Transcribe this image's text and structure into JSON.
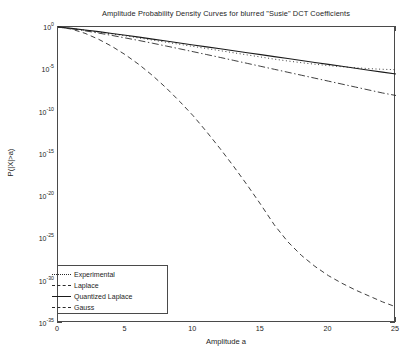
{
  "chart_data": {
    "type": "line",
    "title": "Amplitude Probability Density Curves for blurred \"Susie\" DCT Coefficients",
    "xlabel": "Amplitude a",
    "ylabel": "P(|X|>a)",
    "xlim": [
      0,
      25
    ],
    "ylim_log10": [
      -35,
      0
    ],
    "yscale": "log",
    "grid": false,
    "legend_position": "bottom-left",
    "xticks": [
      0,
      5,
      10,
      15,
      20,
      25
    ],
    "ytick_labels": [
      "10 0",
      "10 -5",
      "10 -10",
      "10 -15",
      "10 -20",
      "10 -25",
      "10 -30",
      "10 -35"
    ],
    "ytick_exponents": [
      0,
      -5,
      -10,
      -15,
      -20,
      -25,
      -30,
      -35
    ],
    "x": [
      0,
      1,
      2,
      3,
      4,
      5,
      6,
      7,
      8,
      9,
      10,
      11,
      12,
      13,
      14,
      15,
      16,
      17,
      18,
      19,
      20,
      21,
      22,
      23,
      24,
      25
    ],
    "series": [
      {
        "name": "Experimental",
        "style": "dotted",
        "color": "#2a2a2a",
        "values_log10": [
          0,
          -0.18,
          -0.38,
          -0.6,
          -0.82,
          -1.05,
          -1.3,
          -1.55,
          -1.8,
          -2.05,
          -2.3,
          -2.55,
          -2.8,
          -3.05,
          -3.3,
          -3.55,
          -3.8,
          -4.02,
          -4.22,
          -4.4,
          -4.56,
          -4.7,
          -4.82,
          -4.92,
          -5.0,
          -5.05
        ]
      },
      {
        "name": "Laplace",
        "style": "dashdot",
        "color": "#2a2a2a",
        "values_log10": [
          0,
          -0.2,
          -0.45,
          -0.72,
          -1.0,
          -1.3,
          -1.6,
          -1.92,
          -2.25,
          -2.58,
          -2.92,
          -3.26,
          -3.6,
          -3.95,
          -4.3,
          -4.65,
          -5.0,
          -5.35,
          -5.7,
          -6.05,
          -6.4,
          -6.75,
          -7.1,
          -7.45,
          -7.8,
          -8.1
        ]
      },
      {
        "name": "Quantized Laplace",
        "style": "solid",
        "color": "#1a1a1a",
        "values_log10": [
          0,
          -0.16,
          -0.35,
          -0.55,
          -0.76,
          -0.98,
          -1.2,
          -1.43,
          -1.66,
          -1.89,
          -2.12,
          -2.35,
          -2.58,
          -2.81,
          -3.04,
          -3.27,
          -3.5,
          -3.73,
          -3.96,
          -4.19,
          -4.42,
          -4.65,
          -4.88,
          -5.11,
          -5.34,
          -5.55
        ]
      },
      {
        "name": "Gauss",
        "style": "dashed",
        "color": "#2a2a2a",
        "values_log10": [
          0,
          -0.25,
          -0.75,
          -1.45,
          -2.3,
          -3.3,
          -4.45,
          -5.75,
          -7.2,
          -8.8,
          -10.5,
          -12.4,
          -14.4,
          -16.5,
          -18.7,
          -21.0,
          -23.4,
          -25.4,
          -27.0,
          -28.3,
          -29.4,
          -30.3,
          -31.1,
          -31.8,
          -32.5,
          -33.1
        ]
      }
    ]
  }
}
